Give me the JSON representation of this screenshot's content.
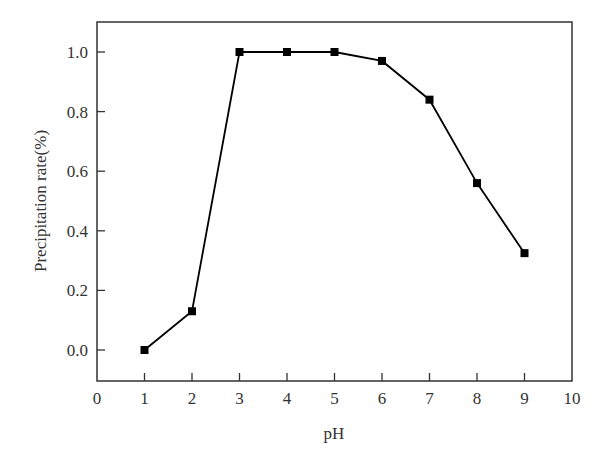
{
  "chart_data": {
    "type": "line",
    "title": "",
    "xlabel": "pH",
    "ylabel": "Precipitation rate(%)",
    "xlim": [
      0,
      10
    ],
    "ylim": [
      -0.1,
      1.1
    ],
    "xticks": [
      0,
      1,
      2,
      3,
      4,
      5,
      6,
      7,
      8,
      9,
      10
    ],
    "yticks": [
      0.0,
      0.2,
      0.4,
      0.6,
      0.8,
      1.0
    ],
    "xtick_labels": [
      "0",
      "1",
      "2",
      "3",
      "4",
      "5",
      "6",
      "7",
      "8",
      "9",
      "10"
    ],
    "ytick_labels": [
      "0.0",
      "0.2",
      "0.4",
      "0.6",
      "0.8",
      "1.0"
    ],
    "grid": false,
    "legend": null,
    "marker": "square",
    "series": [
      {
        "name": "Precipitation rate",
        "x": [
          1,
          2,
          3,
          4,
          5,
          6,
          7,
          8,
          9
        ],
        "values": [
          0.0,
          0.13,
          1.0,
          1.0,
          1.0,
          0.97,
          0.84,
          0.56,
          0.325
        ],
        "color": "#000000"
      }
    ]
  }
}
